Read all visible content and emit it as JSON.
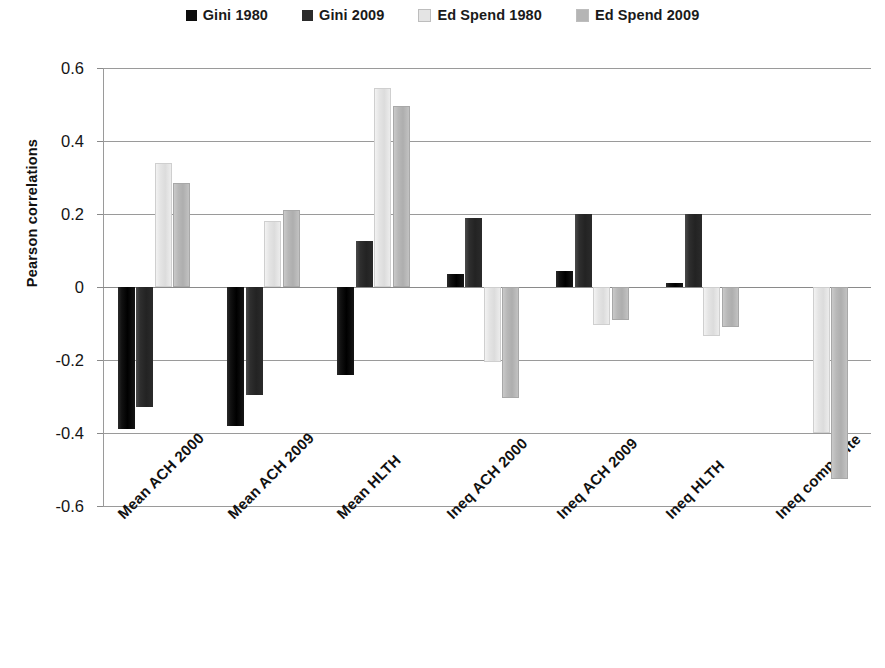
{
  "legend": {
    "items": [
      {
        "label": "Gini 1980",
        "color": "#0d0d0d"
      },
      {
        "label": "Gini 2009",
        "color": "#2b2b2b"
      },
      {
        "label": "Ed Spend 1980",
        "color": "#e4e4e4"
      },
      {
        "label": "Ed Spend 2009",
        "color": "#b5b5b5"
      }
    ]
  },
  "axes": {
    "y_title": "Pearson correlations",
    "y_ticks": [
      "0.6",
      "0.4",
      "0.2",
      "0",
      "-0.2",
      "-0.4",
      "-0.6"
    ],
    "y_min": -0.6,
    "y_max": 0.6,
    "y_step": 0.2,
    "grid": true
  },
  "chart_data": {
    "type": "bar",
    "title": "",
    "xlabel": "",
    "ylabel": "Pearson correlations",
    "ylim": [
      -0.6,
      0.6
    ],
    "ytick_step": 0.2,
    "grid": true,
    "legend_position": "top-center",
    "categories": [
      "Mean ACH 2000",
      "Mean ACH 2009",
      "Mean HLTH",
      "Ineq ACH 2000",
      "Ineq ACH 2009",
      "Ineq HLTH",
      "Ineq composite"
    ],
    "series": [
      {
        "name": "Gini 1980",
        "color": "#0d0d0d",
        "values": [
          -0.39,
          -0.38,
          -0.24,
          0.035,
          0.045,
          0.01,
          0
        ]
      },
      {
        "name": "Gini 2009",
        "color": "#2b2b2b",
        "values": [
          -0.33,
          -0.295,
          0.125,
          0.19,
          0.2,
          0.2,
          0
        ]
      },
      {
        "name": "Ed Spend 1980",
        "color": "#e4e4e4",
        "values": [
          0.34,
          0.18,
          0.545,
          -0.205,
          -0.105,
          -0.135,
          -0.4
        ]
      },
      {
        "name": "Ed Spend 2009",
        "color": "#b5b5b5",
        "values": [
          0.285,
          0.21,
          0.495,
          -0.305,
          -0.09,
          -0.11,
          -0.525
        ]
      }
    ]
  }
}
